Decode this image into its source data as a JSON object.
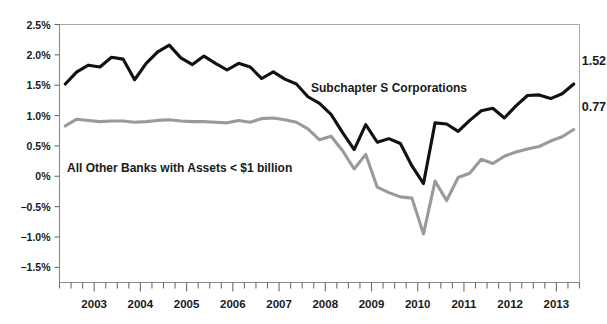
{
  "chart_data": {
    "type": "line",
    "title": "",
    "subtitle": "",
    "xlabel": "",
    "ylabel": "",
    "grid": false,
    "legend_position": "inline-annotation",
    "xlim": [
      2002.25,
      2013.5
    ],
    "ylim": [
      -1.75,
      2.5
    ],
    "y_ticks": [
      2.5,
      2.0,
      1.5,
      1.0,
      0.5,
      0,
      -0.5,
      -1.0,
      -1.5
    ],
    "y_tick_labels": [
      "2.5%",
      "2.0%",
      "1.5%",
      "1.0%",
      "0.5%",
      "0%",
      "−0.5%",
      "−1.0%",
      "−1.5%"
    ],
    "x_ticks": [
      2003,
      2004,
      2005,
      2006,
      2007,
      2008,
      2009,
      2010,
      2011,
      2012,
      2013
    ],
    "x_tick_labels": [
      "2003",
      "2004",
      "2005",
      "2006",
      "2007",
      "2008",
      "2009",
      "2010",
      "2011",
      "2012",
      "2013"
    ],
    "x_minor_ticks_per_year": 4,
    "x": [
      2002.375,
      2002.625,
      2002.875,
      2003.125,
      2003.375,
      2003.625,
      2003.875,
      2004.125,
      2004.375,
      2004.625,
      2004.875,
      2005.125,
      2005.375,
      2005.625,
      2005.875,
      2006.125,
      2006.375,
      2006.625,
      2006.875,
      2007.125,
      2007.375,
      2007.625,
      2007.875,
      2008.125,
      2008.375,
      2008.625,
      2008.875,
      2009.125,
      2009.375,
      2009.625,
      2009.875,
      2010.125,
      2010.375,
      2010.625,
      2010.875,
      2011.125,
      2011.375,
      2011.625,
      2011.875,
      2012.125,
      2012.375,
      2012.625,
      2012.875,
      2013.125,
      2013.375
    ],
    "series": [
      {
        "name": "Subchapter S Corporations",
        "color": "#111111",
        "width": 3.1,
        "end_label": "1.52",
        "end_value": 1.52,
        "values": [
          1.52,
          1.72,
          1.83,
          1.8,
          1.96,
          1.93,
          1.59,
          1.86,
          2.05,
          2.16,
          1.95,
          1.84,
          1.98,
          1.86,
          1.75,
          1.86,
          1.8,
          1.61,
          1.72,
          1.6,
          1.52,
          1.31,
          1.2,
          1.02,
          0.72,
          0.44,
          0.85,
          0.56,
          0.62,
          0.54,
          0.17,
          -0.12,
          0.88,
          0.86,
          0.74,
          0.92,
          1.08,
          1.12,
          0.96,
          1.16,
          1.33,
          1.34,
          1.28,
          1.36,
          1.52
        ]
      },
      {
        "name": "All Other Banks with Assets < $1 billion",
        "color": "#9a9a9a",
        "width": 3.1,
        "end_label": "0.77",
        "end_value": 0.77,
        "values": [
          0.83,
          0.94,
          0.92,
          0.9,
          0.91,
          0.91,
          0.89,
          0.9,
          0.92,
          0.93,
          0.91,
          0.9,
          0.9,
          0.89,
          0.88,
          0.92,
          0.89,
          0.95,
          0.96,
          0.93,
          0.89,
          0.78,
          0.6,
          0.66,
          0.42,
          0.12,
          0.36,
          -0.18,
          -0.27,
          -0.34,
          -0.36,
          -0.95,
          -0.08,
          -0.4,
          -0.02,
          0.05,
          0.28,
          0.21,
          0.33,
          0.4,
          0.45,
          0.49,
          0.58,
          0.65,
          0.77
        ]
      }
    ],
    "annotations": [
      {
        "name": "subchapter-s-label",
        "text": "Subchapter S Corporations",
        "x_px": 311,
        "y_px": 92
      },
      {
        "name": "other-banks-label",
        "text": "All Other Banks with Assets < $1 billion",
        "x_px": 67,
        "y_px": 172
      }
    ]
  },
  "axes": {
    "y_axis_name": "percent-return-axis",
    "x_axis_name": "year-axis"
  }
}
